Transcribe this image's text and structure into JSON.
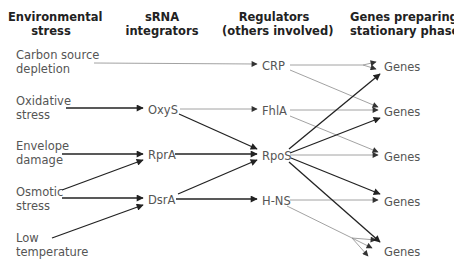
{
  "headers": {
    "stress": [
      "Environmental",
      "stress"
    ],
    "srna": [
      "sRNA",
      "integrators"
    ],
    "regulators": [
      "Regulators",
      "(others involved)"
    ],
    "genes": [
      "Genes preparing",
      "stationary phase"
    ]
  },
  "stresses": [
    {
      "id": "carbon",
      "lines": [
        "Carbon source",
        "depletion"
      ]
    },
    {
      "id": "oxidative",
      "lines": [
        "Oxidative",
        "stress"
      ]
    },
    {
      "id": "envelope",
      "lines": [
        "Envelope",
        "damage"
      ]
    },
    {
      "id": "osmotic",
      "lines": [
        "Osmotic",
        "stress"
      ]
    },
    {
      "id": "low-temp",
      "lines": [
        "Low",
        "temperature"
      ]
    }
  ],
  "srnas": [
    {
      "id": "oxys",
      "label": "OxyS"
    },
    {
      "id": "rpra",
      "label": "RprA"
    },
    {
      "id": "dsra",
      "label": "DsrA"
    }
  ],
  "regulators": [
    {
      "id": "crp",
      "label": "CRP"
    },
    {
      "id": "fhla",
      "label": "FhlA"
    },
    {
      "id": "rpos",
      "label": "RpoS"
    },
    {
      "id": "hns",
      "label": "H-NS"
    }
  ],
  "genes": [
    {
      "id": "genes-1",
      "label": "Genes"
    },
    {
      "id": "genes-2",
      "label": "Genes"
    },
    {
      "id": "genes-3",
      "label": "Genes"
    },
    {
      "id": "genes-4",
      "label": "Genes"
    },
    {
      "id": "genes-5",
      "label": "Genes"
    }
  ],
  "edges": [
    {
      "from": "Carbon source depletion",
      "to": "CRP",
      "weight": "thin"
    },
    {
      "from": "Oxidative stress",
      "to": "OxyS",
      "weight": "thick"
    },
    {
      "from": "Envelope damage",
      "to": "RprA",
      "weight": "thick"
    },
    {
      "from": "Osmotic stress",
      "to": "RprA",
      "weight": "thick"
    },
    {
      "from": "Osmotic stress",
      "to": "DsrA",
      "weight": "thick"
    },
    {
      "from": "Low temperature",
      "to": "DsrA",
      "weight": "thick"
    },
    {
      "from": "OxyS",
      "to": "FhlA",
      "weight": "thin"
    },
    {
      "from": "OxyS",
      "to": "RpoS",
      "weight": "thick"
    },
    {
      "from": "RprA",
      "to": "RpoS",
      "weight": "thick"
    },
    {
      "from": "DsrA",
      "to": "RpoS",
      "weight": "thick"
    },
    {
      "from": "DsrA",
      "to": "H-NS",
      "weight": "thick"
    },
    {
      "from": "CRP",
      "to": "Genes 1",
      "weight": "thin",
      "type": "repression"
    },
    {
      "from": "CRP",
      "to": "Genes 2",
      "weight": "thin"
    },
    {
      "from": "FhlA",
      "to": "Genes 2",
      "weight": "thin"
    },
    {
      "from": "FhlA",
      "to": "Genes 3",
      "weight": "thin"
    },
    {
      "from": "RpoS",
      "to": "Genes 1",
      "weight": "thick"
    },
    {
      "from": "RpoS",
      "to": "Genes 2",
      "weight": "thick"
    },
    {
      "from": "RpoS",
      "to": "Genes 3",
      "weight": "thin"
    },
    {
      "from": "RpoS",
      "to": "Genes 4",
      "weight": "thick"
    },
    {
      "from": "RpoS",
      "to": "Genes 5",
      "weight": "thick"
    },
    {
      "from": "H-NS",
      "to": "Genes 4",
      "weight": "thin"
    },
    {
      "from": "H-NS",
      "to": "Genes 5",
      "weight": "thin",
      "type": "fan-out"
    }
  ],
  "colors": {
    "thick_arrow": "#222222",
    "thin_arrow": "#888888",
    "text": "#555555",
    "header": "#222222"
  }
}
